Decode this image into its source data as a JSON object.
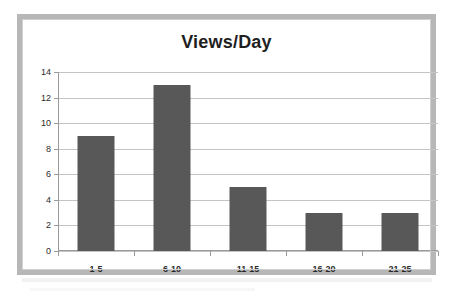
{
  "chart_data": {
    "type": "bar",
    "title": "Views/Day",
    "xlabel": "",
    "ylabel": "",
    "categories": [
      "1-5",
      "6-10",
      "11-15",
      "16-20",
      "21-25"
    ],
    "values": [
      9,
      13,
      5,
      3,
      3
    ],
    "ylim": [
      0,
      14
    ],
    "ytick_labels": [
      "0",
      "2",
      "4",
      "6",
      "8",
      "10",
      "12",
      "14"
    ],
    "ytick_values": [
      0,
      2,
      4,
      6,
      8,
      10,
      12,
      14
    ],
    "grid": true,
    "legend": false,
    "legend_position": "none",
    "series": [
      {
        "name": "Views/Day",
        "values": [
          9,
          13,
          5,
          3,
          3
        ]
      }
    ],
    "colors": {
      "bar_fill": "#585858",
      "gridline": "#c4c4c4",
      "axis_line": "#9a9a9a",
      "title_text": "#1f1f1f",
      "tick_text": "#2b2b2b",
      "frame_border": "#b7b7b7",
      "plot_background": "#ffffff"
    }
  }
}
